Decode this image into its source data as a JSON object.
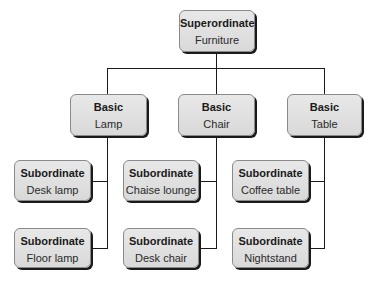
{
  "diagram": {
    "type": "hierarchy",
    "superordinate": {
      "level": "Superordinate",
      "term": "Furniture"
    },
    "basic": [
      {
        "level": "Basic",
        "term": "Lamp",
        "subordinates": [
          {
            "level": "Subordinate",
            "term": "Desk lamp"
          },
          {
            "level": "Subordinate",
            "term": "Floor lamp"
          }
        ]
      },
      {
        "level": "Basic",
        "term": "Chair",
        "subordinates": [
          {
            "level": "Subordinate",
            "term": "Chaise lounge"
          },
          {
            "level": "Subordinate",
            "term": "Desk chair"
          }
        ]
      },
      {
        "level": "Basic",
        "term": "Table",
        "subordinates": [
          {
            "level": "Subordinate",
            "term": "Coffee table"
          },
          {
            "level": "Subordinate",
            "term": "Nightstand"
          }
        ]
      }
    ],
    "colors": {
      "box_fill": "#e0e0e0",
      "line": "#1a1a1a",
      "shadow": "#1a1a1a"
    }
  }
}
